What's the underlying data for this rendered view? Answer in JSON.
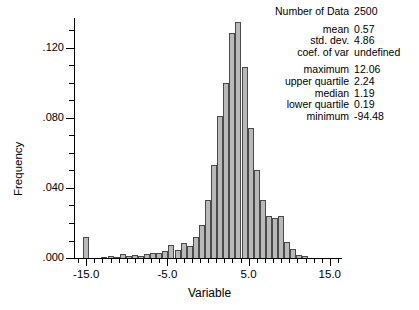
{
  "stats": {
    "rows": [
      {
        "key": "Number of Data",
        "value": "2500"
      },
      {
        "key": "mean",
        "value": "0.57"
      },
      {
        "key": "std. dev.",
        "value": "4.86"
      },
      {
        "key": "coef. of var",
        "value": "undefined"
      },
      {
        "key": "maximum",
        "value": "12.06"
      },
      {
        "key": "upper quartile",
        "value": "2.24"
      },
      {
        "key": "median",
        "value": "1.19"
      },
      {
        "key": "lower quartile",
        "value": "0.19"
      },
      {
        "key": "minimum",
        "value": "-94.48"
      }
    ]
  },
  "axes": {
    "ylabel": "Frequency",
    "xlabel": "Variable",
    "yticks": [
      ".000",
      ".040",
      ".080",
      ".120"
    ],
    "xticks": [
      "-15.0",
      "-5.0",
      "5.0",
      "15.0"
    ]
  },
  "chart_data": {
    "type": "bar",
    "title": "",
    "xlabel": "Variable",
    "ylabel": "Frequency",
    "xlim": [
      -16.5,
      16.5
    ],
    "ylim": [
      0.0,
      0.137
    ],
    "grid": false,
    "legend": null,
    "bin_width": 0.75,
    "bar_color": "#b9b9b9",
    "bar_edge_color": "#4a4a4a",
    "categories": [
      -15.0,
      -14.25,
      -13.5,
      -12.75,
      -12.0,
      -11.25,
      -10.5,
      -9.75,
      -9.0,
      -8.25,
      -7.5,
      -6.75,
      -6.0,
      -5.25,
      -4.5,
      -3.75,
      -3.0,
      -2.25,
      -1.5,
      -0.75,
      0.0,
      0.75,
      1.5,
      2.25,
      3.0,
      3.75,
      4.5,
      5.25,
      6.0,
      6.75,
      7.5,
      8.25,
      9.0,
      9.75,
      10.5,
      11.25,
      12.0
    ],
    "values": [
      0.012,
      0.0,
      0.0,
      0.0005,
      0.0012,
      0.0008,
      0.0022,
      0.0012,
      0.0016,
      0.0009,
      0.0022,
      0.003,
      0.0028,
      0.0042,
      0.0072,
      0.0044,
      0.0088,
      0.0066,
      0.012,
      0.019,
      0.033,
      0.053,
      0.081,
      0.1,
      0.1285,
      0.1345,
      0.109,
      0.0745,
      0.05,
      0.033,
      0.024,
      0.023,
      0.024,
      0.009,
      0.005,
      0.0016,
      0.001
    ],
    "annotations": [
      "Number of Data 2500",
      "mean 0.57",
      "std. dev. 4.86",
      "coef. of var undefined",
      "maximum 12.06",
      "upper quartile 2.24",
      "median 1.19",
      "lower quartile 0.19",
      "minimum -94.48"
    ]
  }
}
